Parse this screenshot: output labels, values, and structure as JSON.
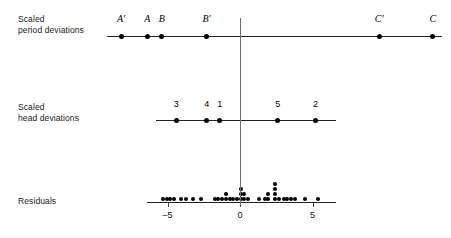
{
  "figure": {
    "width": 451,
    "height": 238,
    "background": "#ffffff",
    "ink_color": "#000000",
    "rule_color": "#222222",
    "center_line_color": "#6f6f6f"
  },
  "rows": [
    {
      "id": "period",
      "label_line1": "Scaled",
      "label_line2": "period deviations"
    },
    {
      "id": "head",
      "label_line1": "Scaled",
      "label_line2": "head deviations"
    },
    {
      "id": "residuals",
      "label_line1": "Residuals",
      "label_line2": ""
    }
  ],
  "axis": {
    "zero_label": "0",
    "neg_five_label": "–5",
    "pos_five_label": "5",
    "ticks": [
      -5,
      0,
      5
    ],
    "tick_labels": [
      "–5",
      "0",
      "5"
    ],
    "range": [
      -7.2,
      6.8
    ]
  },
  "chart_data": {
    "type": "scatter",
    "title": "",
    "subtitle": "",
    "xlabel": "",
    "ylabel": "",
    "grid": false,
    "legend": "none",
    "shared_x_axis": {
      "ticks": [
        -5,
        0,
        5
      ],
      "tick_labels": [
        "–5",
        "0",
        "5"
      ],
      "zero_reference_line": true,
      "xlim": [
        -7.2,
        6.8
      ]
    },
    "panels": [
      {
        "name": "Scaled period deviations",
        "type": "scatter",
        "labelled_points": true,
        "line_extent": [
          -9.2,
          13.9
        ],
        "points": [
          {
            "label": "A′",
            "x": -8.2
          },
          {
            "label": "A",
            "x": -6.4
          },
          {
            "label": "B",
            "x": -5.4
          },
          {
            "label": "B′",
            "x": -2.3
          },
          {
            "label": "C′",
            "x": 9.6
          },
          {
            "label": "C",
            "x": 13.3
          }
        ]
      },
      {
        "name": "Scaled head deviations",
        "type": "scatter",
        "labelled_points": true,
        "line_extent": [
          -5.8,
          6.6
        ],
        "points": [
          {
            "label": "3",
            "x": -4.4
          },
          {
            "label": "4",
            "x": -2.3
          },
          {
            "label": "1",
            "x": -1.4
          },
          {
            "label": "5",
            "x": 2.6
          },
          {
            "label": "2",
            "x": 5.2
          }
        ]
      },
      {
        "name": "Residuals",
        "type": "dotplot",
        "labelled_points": false,
        "line_extent": [
          -6.4,
          6.6
        ],
        "bin_width": 0.28,
        "stacks": [
          {
            "x": -5.3,
            "count": 1
          },
          {
            "x": -5.05,
            "count": 1
          },
          {
            "x": -4.8,
            "count": 1
          },
          {
            "x": -4.55,
            "count": 1
          },
          {
            "x": -4.1,
            "count": 1
          },
          {
            "x": -3.7,
            "count": 1
          },
          {
            "x": -3.25,
            "count": 1
          },
          {
            "x": -2.7,
            "count": 1
          },
          {
            "x": -1.75,
            "count": 1
          },
          {
            "x": -1.5,
            "count": 1
          },
          {
            "x": -1.25,
            "count": 1
          },
          {
            "x": -1.0,
            "count": 2
          },
          {
            "x": -0.7,
            "count": 1
          },
          {
            "x": -0.45,
            "count": 1
          },
          {
            "x": -0.2,
            "count": 1
          },
          {
            "x": 0.05,
            "count": 3
          },
          {
            "x": 0.3,
            "count": 2
          },
          {
            "x": 0.55,
            "count": 1
          },
          {
            "x": 1.3,
            "count": 1
          },
          {
            "x": 1.7,
            "count": 1
          },
          {
            "x": 1.95,
            "count": 2
          },
          {
            "x": 2.4,
            "count": 4
          },
          {
            "x": 2.7,
            "count": 1
          },
          {
            "x": 3.0,
            "count": 1
          },
          {
            "x": 3.25,
            "count": 1
          },
          {
            "x": 3.55,
            "count": 1
          },
          {
            "x": 3.8,
            "count": 1
          },
          {
            "x": 4.5,
            "count": 1
          },
          {
            "x": 5.4,
            "count": 1
          }
        ]
      }
    ]
  }
}
